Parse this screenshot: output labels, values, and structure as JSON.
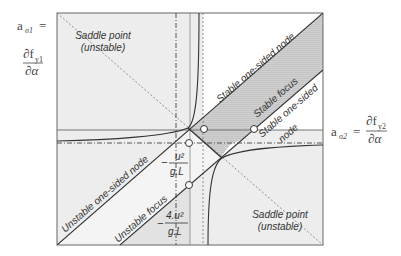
{
  "diagram": {
    "colors": {
      "light_region": "#eeeeee",
      "focus_region": "#c8c8c8",
      "line": "#333333",
      "dashdot": "#555555"
    },
    "axes": {
      "y_axis": {
        "symbol": "a",
        "subscript": "σ1",
        "equals": "=",
        "numerator": "∂f",
        "numerator_sub": "y1",
        "denominator": "∂α"
      },
      "x_axis": {
        "symbol": "a",
        "subscript": "σ2",
        "equals": "=",
        "numerator": "∂f",
        "numerator_sub": "y2",
        "denominator": "∂α"
      }
    },
    "regions": {
      "saddle_top_left": {
        "line1": "Saddle point",
        "line2": "(unstable)"
      },
      "saddle_bottom_right": {
        "line1": "Saddle point",
        "line2": "(unstable)"
      },
      "stable_one_sided_node_upper": "Stable one-sided node",
      "stable_focus": "Stable focus",
      "stable_one_sided_node_lower_1": "Stable one-sided",
      "stable_one_sided_node_lower_2": "node",
      "unstable_one_sided_node": "Unstable one-sided node",
      "unstable_focus": "Unstable focus"
    },
    "markers": {
      "marker1": {
        "minus": "−",
        "numerator": "u²",
        "denominator": "g.L"
      },
      "marker2": {
        "minus": "−",
        "numerator": "4.u²",
        "denominator": "g.L"
      }
    }
  }
}
